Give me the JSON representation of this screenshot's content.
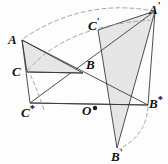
{
  "figure": {
    "background": "#fdfdfd",
    "stroke_color": "#3a3a3a",
    "fill_color": "#e6e6e6",
    "dash_color": "#9a9a9a",
    "width": 168,
    "height": 164
  },
  "points": {
    "A": {
      "label": "A",
      "mark": "",
      "x": 22,
      "y": 40
    },
    "B": {
      "label": "B",
      "mark": "",
      "x": 83,
      "y": 73
    },
    "C": {
      "label": "C",
      "mark": "",
      "x": 27,
      "y": 72
    },
    "Aprime": {
      "label": "A",
      "mark": "'",
      "x": 155,
      "y": 11
    },
    "Bprime": {
      "label": "B",
      "mark": "'",
      "x": 117,
      "y": 148
    },
    "Cprime": {
      "label": "C",
      "mark": "'",
      "x": 98,
      "y": 30
    },
    "Astar": {
      "label": "A",
      "mark": "*",
      "x": 155,
      "y": 11
    },
    "Bstar": {
      "label": "B",
      "mark": "*",
      "x": 148,
      "y": 105
    },
    "Cstar": {
      "label": "C",
      "mark": "*",
      "x": 30,
      "y": 103
    },
    "O": {
      "label": "O",
      "mark": "",
      "x": 92,
      "y": 108
    }
  },
  "labels": [
    {
      "name": "label-A",
      "text": "A",
      "mark": "",
      "x": 8,
      "y": 32
    },
    {
      "name": "label-B",
      "text": "B",
      "mark": "",
      "x": 86,
      "y": 57
    },
    {
      "name": "label-C",
      "text": "C",
      "mark": "",
      "x": 13,
      "y": 64
    },
    {
      "name": "label-A-prime",
      "text": "A",
      "mark": "'",
      "x": 150,
      "y": 2
    },
    {
      "name": "label-B-prime",
      "text": "B",
      "mark": "'",
      "x": 112,
      "y": 149
    },
    {
      "name": "label-C-prime",
      "text": "C",
      "mark": "'",
      "x": 88,
      "y": 18
    },
    {
      "name": "label-A-star",
      "text": "A",
      "mark": "*",
      "x": 150,
      "y": 2
    },
    {
      "name": "label-B-star",
      "text": "B",
      "mark": "*",
      "x": 150,
      "y": 96
    },
    {
      "name": "label-C-star",
      "text": "C",
      "mark": "*",
      "x": 22,
      "y": 105
    },
    {
      "name": "label-O",
      "text": "O",
      "mark": "",
      "x": 82,
      "y": 103
    }
  ],
  "shapes": {
    "triangle_abc": {
      "name": "triangle-ABC",
      "points": "22,40 83,73 27,72",
      "filled": true
    },
    "triangle_abc_prime": {
      "name": "triangle-A-B-C-prime",
      "points": "155,11 117,148 98,30",
      "filled": true
    },
    "triangle_abc_star": {
      "name": "triangle-A-B-C-star",
      "points": "155,11 148,105 30,103",
      "filled": false
    }
  },
  "segments": [
    {
      "name": "segment-A-to-Cstar",
      "x1": 22,
      "y1": 40,
      "x2": 30,
      "y2": 103
    },
    {
      "name": "segment-A-to-Bstar",
      "x1": 22,
      "y1": 40,
      "x2": 148,
      "y2": 105
    },
    {
      "name": "segment-C-to-B",
      "x1": 27,
      "y1": 72,
      "x2": 83,
      "y2": 73
    },
    {
      "name": "segment-Cstar-to-Bstar",
      "x1": 30,
      "y1": 103,
      "x2": 148,
      "y2": 105
    }
  ],
  "arcs": [
    {
      "name": "arc-A-to-Aprime",
      "d": "M 24,38 Q 84,-2 154,11"
    },
    {
      "name": "arc-C-to-Cprime",
      "d": "M 28,70 Q 66,26 150,20"
    },
    {
      "name": "arc-C-to-Cstar",
      "d": "M 28,70 Q 36,86 44,110"
    },
    {
      "name": "arc-Bstar-to-Bprime",
      "d": "M 148,107 Q 146,136 119,149"
    }
  ],
  "center_marker": {
    "name": "center-point-O",
    "x": 95,
    "y": 108,
    "radius": 2.2
  }
}
